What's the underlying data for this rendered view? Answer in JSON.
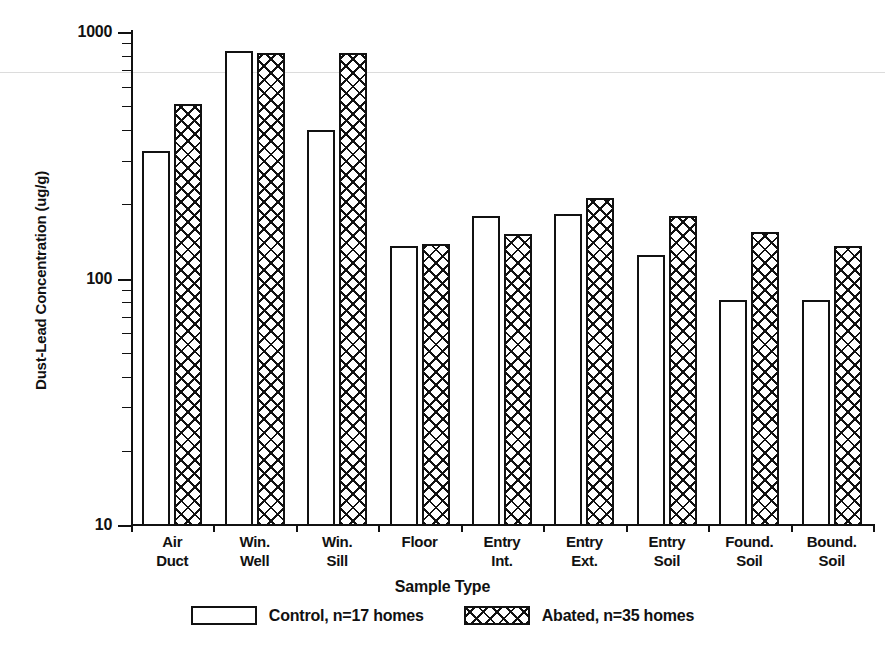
{
  "chart_data": {
    "type": "bar",
    "title": "",
    "xlabel": "Sample Type",
    "ylabel": "Dust-Lead Concentration (ug/g)",
    "yscale": "log",
    "ylim": [
      10,
      1000
    ],
    "ytick_labels": [
      "10",
      "100",
      "1000"
    ],
    "ytick_values": [
      10,
      100,
      1000
    ],
    "grid": false,
    "legend_position": "bottom",
    "categories": [
      "Air\nDuct",
      "Win.\nWell",
      "Win.\nSill",
      "Floor",
      "Entry\nInt.",
      "Entry\nExt.",
      "Entry\nSoil",
      "Found.\nSoil",
      "Bound.\nSoil"
    ],
    "series": [
      {
        "name": "Control, n=17 homes",
        "short_name": "Control",
        "pattern": "open",
        "values": [
          330,
          840,
          400,
          135,
          180,
          182,
          124,
          82,
          82
        ]
      },
      {
        "name": "Abated, n=35 homes",
        "short_name": "Abated",
        "pattern": "crosshatch",
        "values": [
          510,
          820,
          825,
          138,
          152,
          212,
          180,
          155,
          135
        ]
      }
    ]
  },
  "axes": {
    "y_title": "Dust-Lead Concentration (ug/g)",
    "x_title": "Sample Type",
    "y_ticks": [
      {
        "label": "1000",
        "value": 1000
      },
      {
        "label": "100",
        "value": 100
      },
      {
        "label": "10",
        "value": 10
      }
    ]
  },
  "legend": {
    "items": [
      {
        "label": "Control, n=17 homes",
        "swatch": "open-rectangle-swatch"
      },
      {
        "label": "Abated, n=35 homes",
        "swatch": "crosshatch-rectangle-swatch"
      }
    ]
  },
  "colors": {
    "ink": "#111111",
    "background": "#ffffff",
    "scan_artifact_line": "#dcdcdc"
  }
}
